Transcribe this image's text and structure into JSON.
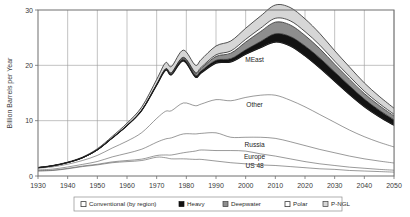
{
  "chart_data": {
    "type": "area",
    "title": "",
    "xlabel": "",
    "ylabel": "Billion Barrels per Year",
    "xlim": [
      1930,
      2050
    ],
    "ylim": [
      0,
      30
    ],
    "xticks": [
      "1930",
      "1940",
      "1950",
      "1960",
      "1970",
      "1980",
      "1990",
      "2000",
      "2010",
      "2020",
      "2030",
      "2040",
      "2050"
    ],
    "yticks": [
      "0",
      "10",
      "20",
      "30"
    ],
    "grid": true,
    "legend_position": "bottom",
    "stacked": true,
    "x": [
      1930,
      1935,
      1940,
      1945,
      1950,
      1955,
      1960,
      1965,
      1970,
      1973,
      1975,
      1979,
      1983,
      1985,
      1990,
      1995,
      2000,
      2005,
      2010,
      2015,
      2020,
      2025,
      2030,
      2035,
      2040,
      2045,
      2050
    ],
    "series": [
      {
        "name": "US 48",
        "color": "#ffffff",
        "values": [
          0.9,
          1.0,
          1.3,
          1.7,
          2.0,
          2.4,
          2.6,
          2.8,
          3.4,
          3.3,
          3.1,
          3.1,
          3.0,
          3.0,
          2.7,
          2.4,
          2.2,
          2.0,
          1.9,
          1.7,
          1.5,
          1.3,
          1.2,
          1.0,
          0.9,
          0.8,
          0.7
        ]
      },
      {
        "name": "Europe",
        "color": "#ffffff",
        "values": [
          0.05,
          0.05,
          0.08,
          0.1,
          0.12,
          0.15,
          0.2,
          0.25,
          0.3,
          0.5,
          0.7,
          1.1,
          1.5,
          1.7,
          1.9,
          2.2,
          2.3,
          2.0,
          1.7,
          1.4,
          1.1,
          0.9,
          0.7,
          0.6,
          0.5,
          0.4,
          0.35
        ]
      },
      {
        "name": "Russia",
        "color": "#ffffff",
        "values": [
          0.15,
          0.2,
          0.25,
          0.3,
          0.5,
          0.9,
          1.3,
          1.8,
          2.4,
          2.9,
          3.1,
          3.4,
          3.1,
          3.0,
          3.2,
          2.4,
          2.5,
          3.0,
          3.2,
          3.1,
          2.9,
          2.6,
          2.3,
          2.0,
          1.7,
          1.5,
          1.3
        ]
      },
      {
        "name": "Other",
        "color": "#ffffff",
        "values": [
          0.3,
          0.4,
          0.5,
          0.7,
          1.1,
          1.6,
          2.2,
          3.0,
          4.3,
          5.0,
          4.9,
          5.6,
          5.1,
          5.3,
          6.0,
          6.6,
          7.2,
          7.6,
          7.8,
          7.5,
          7.0,
          6.3,
          5.5,
          4.7,
          4.0,
          3.4,
          2.9
        ]
      },
      {
        "name": "MEast",
        "color": "#ffffff",
        "values": [
          0.1,
          0.2,
          0.3,
          0.5,
          1.0,
          1.8,
          2.8,
          4.0,
          6.0,
          7.4,
          6.5,
          7.6,
          5.2,
          5.6,
          6.6,
          7.0,
          7.8,
          8.6,
          9.6,
          9.8,
          9.2,
          8.4,
          7.4,
          6.4,
          5.4,
          4.6,
          3.9
        ]
      },
      {
        "name": "Heavy",
        "color": "#121212",
        "values": [
          0.0,
          0.0,
          0.0,
          0.0,
          0.0,
          0.0,
          0.0,
          0.05,
          0.1,
          0.15,
          0.2,
          0.3,
          0.35,
          0.4,
          0.5,
          0.6,
          0.8,
          1.1,
          1.5,
          1.7,
          1.8,
          1.8,
          1.7,
          1.6,
          1.4,
          1.2,
          1.0
        ]
      },
      {
        "name": "Deepwater",
        "color": "#8e8e8e",
        "values": [
          0.0,
          0.0,
          0.0,
          0.0,
          0.0,
          0.0,
          0.0,
          0.0,
          0.05,
          0.1,
          0.15,
          0.25,
          0.35,
          0.45,
          0.7,
          1.0,
          1.4,
          1.8,
          2.1,
          2.1,
          1.9,
          1.7,
          1.4,
          1.2,
          1.0,
          0.85,
          0.7
        ]
      },
      {
        "name": "Polar",
        "color": "#ffffff",
        "values": [
          0.0,
          0.0,
          0.0,
          0.0,
          0.0,
          0.0,
          0.0,
          0.0,
          0.0,
          0.02,
          0.05,
          0.1,
          0.15,
          0.2,
          0.3,
          0.4,
          0.5,
          0.6,
          0.7,
          0.75,
          0.7,
          0.65,
          0.55,
          0.5,
          0.42,
          0.36,
          0.3
        ]
      },
      {
        "name": "P-NGL",
        "color": "#d6d6d6",
        "values": [
          0.05,
          0.06,
          0.08,
          0.12,
          0.2,
          0.3,
          0.45,
          0.6,
          0.9,
          1.1,
          1.1,
          1.3,
          1.3,
          1.4,
          1.6,
          1.8,
          2.0,
          2.2,
          2.4,
          2.4,
          2.3,
          2.1,
          1.9,
          1.7,
          1.5,
          1.3,
          1.1
        ]
      }
    ],
    "annotations": [
      {
        "label": "MEast",
        "x": 2003,
        "y": 20.6
      },
      {
        "label": "Other",
        "x": 2003,
        "y": 12.4
      },
      {
        "label": "Russia",
        "x": 2003,
        "y": 5.3
      },
      {
        "label": "Europe",
        "x": 2003,
        "y": 3.1
      },
      {
        "label": "US 48",
        "x": 2003,
        "y": 1.5
      }
    ],
    "legend": [
      {
        "label": "Conventional (by region)",
        "swatch": "open"
      },
      {
        "label": "Heavy",
        "swatch": "heavy"
      },
      {
        "label": "Deepwater",
        "swatch": "deep"
      },
      {
        "label": "Polar",
        "swatch": "polar"
      },
      {
        "label": "P-NGL",
        "swatch": "pngl"
      }
    ]
  }
}
